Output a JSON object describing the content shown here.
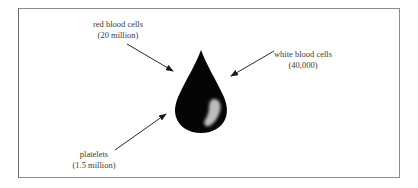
{
  "diagram": {
    "colors": {
      "drop": "#050505",
      "highlight": "#bdbdbd",
      "arrow": "#2a2a2a",
      "frame": "#8a8a8a",
      "text": "#3a3a3a"
    },
    "labels": [
      {
        "id": "red-blood-cells",
        "name": "red blood cells",
        "count": "(20 million)",
        "position": {
          "x": 118,
          "y": 20
        },
        "arrow": {
          "x1": 127,
          "y1": 44,
          "x2": 173,
          "y2": 71
        }
      },
      {
        "id": "white-blood-cells",
        "name": "white blood cells",
        "count": "(40,000)",
        "position": {
          "x": 303,
          "y": 50
        },
        "arrow": {
          "x1": 274,
          "y1": 51,
          "x2": 231,
          "y2": 76
        }
      },
      {
        "id": "platelets",
        "name": "platelets",
        "count": "(1.5 million)",
        "position": {
          "x": 94,
          "y": 150
        },
        "arrow": {
          "x1": 115,
          "y1": 150,
          "x2": 166,
          "y2": 114
        }
      }
    ]
  }
}
